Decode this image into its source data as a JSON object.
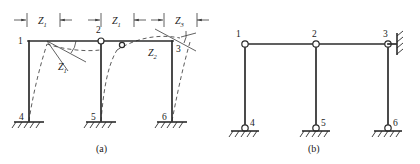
{
  "figure": {
    "caption_a": "(a)",
    "caption_b": "(b)",
    "colors": {
      "member": "#2b2b2b",
      "deflected": "#4a4a4a",
      "thin": "#3a3a3a",
      "background": "#ffffff"
    }
  },
  "panel_a": {
    "name": "Original frame with deflected shape and unknowns",
    "dimension_labels": [
      {
        "id": "dim-left",
        "text": "Z",
        "sub": "1"
      },
      {
        "id": "dim-mid",
        "text": "Z",
        "sub": "1"
      },
      {
        "id": "dim-right",
        "text": "Z",
        "sub": "3"
      }
    ],
    "unknown_labels": [
      {
        "id": "rot-node-1",
        "text": "Z",
        "sub": "1"
      },
      {
        "id": "rot-node-3",
        "text": "Z",
        "sub": "2"
      }
    ],
    "nodes": [
      {
        "id": "n1",
        "label": "1"
      },
      {
        "id": "n2",
        "label": "2"
      },
      {
        "id": "n3",
        "label": "3"
      },
      {
        "id": "n4",
        "label": "4"
      },
      {
        "id": "n5",
        "label": "5"
      },
      {
        "id": "n6",
        "label": "6"
      }
    ]
  },
  "panel_b": {
    "name": "Primary system with hinges and link support",
    "nodes": [
      {
        "id": "n1",
        "label": "1"
      },
      {
        "id": "n2",
        "label": "2"
      },
      {
        "id": "n3",
        "label": "3"
      },
      {
        "id": "n4",
        "label": "4"
      },
      {
        "id": "n5",
        "label": "5"
      },
      {
        "id": "n6",
        "label": "6"
      }
    ]
  }
}
